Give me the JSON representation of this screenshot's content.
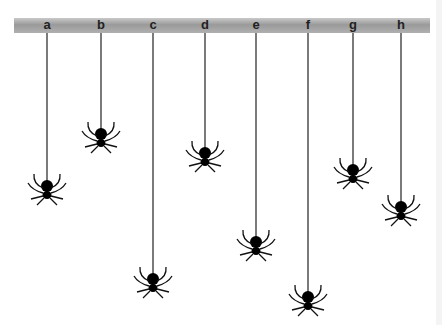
{
  "diagram": {
    "bar_top": 33,
    "spiders": [
      {
        "label": "a",
        "x": 47,
        "y": 186
      },
      {
        "label": "b",
        "x": 101,
        "y": 134
      },
      {
        "label": "c",
        "x": 153,
        "y": 279
      },
      {
        "label": "d",
        "x": 205,
        "y": 153
      },
      {
        "label": "e",
        "x": 256,
        "y": 242
      },
      {
        "label": "f",
        "x": 308,
        "y": 297
      },
      {
        "label": "g",
        "x": 353,
        "y": 170
      },
      {
        "label": "h",
        "x": 401,
        "y": 207
      }
    ]
  }
}
